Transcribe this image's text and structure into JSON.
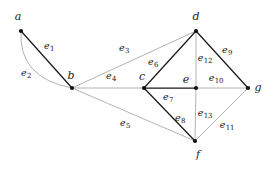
{
  "figure": {
    "type": "graph-diagram",
    "width": 274,
    "height": 169,
    "background": "#ffffff",
    "dark_edge_color": "#1a1a1a",
    "light_edge_color": "#9a9a9a",
    "vertex_color": "#111111"
  },
  "vertices": [
    {
      "id": "a",
      "label": "a",
      "x": 21,
      "y": 31,
      "label_x": 18,
      "label_y": 16
    },
    {
      "id": "b",
      "label": "b",
      "x": 72,
      "y": 88,
      "label_x": 71,
      "label_y": 75
    },
    {
      "id": "c",
      "label": "c",
      "x": 144,
      "y": 88,
      "label_x": 142,
      "label_y": 76
    },
    {
      "id": "d",
      "label": "d",
      "x": 196,
      "y": 31,
      "label_x": 196,
      "label_y": 16
    },
    {
      "id": "e",
      "label": "e",
      "x": 196,
      "y": 88,
      "label_x": 186,
      "label_y": 79
    },
    {
      "id": "f",
      "label": "f",
      "x": 195,
      "y": 141,
      "label_x": 198,
      "label_y": 154
    },
    {
      "id": "g",
      "label": "g",
      "x": 248,
      "y": 88,
      "label_x": 258,
      "label_y": 87
    }
  ],
  "edges": [
    {
      "id": "e1",
      "label": "e",
      "sub": "1",
      "from": "a",
      "to": "b",
      "curved": false,
      "weight": "dark",
      "label_x": 49,
      "label_y": 46
    },
    {
      "id": "e2",
      "label": "e",
      "sub": "2",
      "from": "a",
      "to": "b",
      "curved": true,
      "weight": "light",
      "label_x": 26,
      "label_y": 73,
      "bow_x": 18,
      "bow_y": 78
    },
    {
      "id": "e3",
      "label": "e",
      "sub": "3",
      "from": "b",
      "to": "d",
      "curved": false,
      "weight": "light",
      "label_x": 124,
      "label_y": 48
    },
    {
      "id": "e4",
      "label": "e",
      "sub": "4",
      "from": "b",
      "to": "c",
      "curved": false,
      "weight": "light",
      "label_x": 111,
      "label_y": 76
    },
    {
      "id": "e5",
      "label": "e",
      "sub": "5",
      "from": "b",
      "to": "f",
      "curved": false,
      "weight": "light",
      "label_x": 125,
      "label_y": 123
    },
    {
      "id": "e6",
      "label": "e",
      "sub": "6",
      "from": "c",
      "to": "d",
      "curved": false,
      "weight": "dark",
      "label_x": 153,
      "label_y": 62
    },
    {
      "id": "e7",
      "label": "e",
      "sub": "7",
      "from": "c",
      "to": "e",
      "curved": false,
      "weight": "dark",
      "label_x": 168,
      "label_y": 97
    },
    {
      "id": "e8",
      "label": "e",
      "sub": "8",
      "from": "c",
      "to": "f",
      "curved": false,
      "weight": "dark",
      "label_x": 180,
      "label_y": 118
    },
    {
      "id": "e9",
      "label": "e",
      "sub": "9",
      "from": "d",
      "to": "g",
      "curved": false,
      "weight": "dark",
      "label_x": 227,
      "label_y": 50
    },
    {
      "id": "e10",
      "label": "e",
      "sub": "10",
      "from": "e",
      "to": "g",
      "curved": false,
      "weight": "light",
      "label_x": 216,
      "label_y": 78
    },
    {
      "id": "e11",
      "label": "e",
      "sub": "11",
      "from": "f",
      "to": "g",
      "curved": false,
      "weight": "light",
      "label_x": 227,
      "label_y": 125
    },
    {
      "id": "e12",
      "label": "e",
      "sub": "12",
      "from": "d",
      "to": "e",
      "curved": false,
      "weight": "light",
      "label_x": 205,
      "label_y": 58
    },
    {
      "id": "e13",
      "label": "e",
      "sub": "13",
      "from": "e",
      "to": "f",
      "curved": false,
      "weight": "light",
      "label_x": 205,
      "label_y": 113
    }
  ]
}
